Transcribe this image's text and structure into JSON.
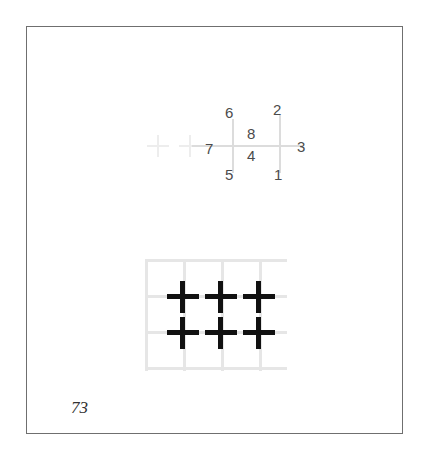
{
  "page": {
    "number": "73",
    "background_color": "#ffffff",
    "border_color": "#6f6f6f"
  },
  "top_diagram": {
    "name": "numbered-cross-reference-diagram",
    "grid_color": "#dcdcdc",
    "faint_cross_color": "#ededed",
    "label_color": "#4b4b4b",
    "faint_crosses": [
      {
        "id": "faint-cross-1",
        "x": 10,
        "y": 38
      },
      {
        "id": "faint-cross-2",
        "x": 42,
        "y": 38
      }
    ],
    "labels": [
      {
        "id": "label-6",
        "text": "6",
        "x": 88,
        "y": 8,
        "position": "top-left"
      },
      {
        "id": "label-2",
        "text": "2",
        "x": 136,
        "y": 5,
        "position": "top-right"
      },
      {
        "id": "label-8",
        "text": "8",
        "x": 110,
        "y": 29,
        "position": "center-upper"
      },
      {
        "id": "label-7",
        "text": "7",
        "x": 68,
        "y": 44,
        "position": "middle-left"
      },
      {
        "id": "label-3",
        "text": "3",
        "x": 160,
        "y": 42,
        "position": "middle-right"
      },
      {
        "id": "label-4",
        "text": "4",
        "x": 110,
        "y": 51,
        "position": "center-lower"
      },
      {
        "id": "label-5",
        "text": "5",
        "x": 88,
        "y": 70,
        "position": "bottom-left"
      },
      {
        "id": "label-1",
        "text": "1",
        "x": 137,
        "y": 70,
        "position": "bottom-right"
      }
    ]
  },
  "bottom_diagram": {
    "name": "cross-grid-diagram",
    "grid_color": "#e6e6e6",
    "cross_color": "#111111",
    "grid": {
      "vertical_line_x": [
        0,
        38,
        76,
        114
      ],
      "horizontal_line_y": [
        0,
        36,
        72,
        108
      ],
      "columns": 4,
      "rows": 4
    },
    "crosses": [
      {
        "id": "cross-r1c1",
        "row": 1,
        "col": 1,
        "x": 22,
        "y": 22
      },
      {
        "id": "cross-r1c2",
        "row": 1,
        "col": 2,
        "x": 60,
        "y": 22
      },
      {
        "id": "cross-r1c3",
        "row": 1,
        "col": 3,
        "x": 98,
        "y": 22
      },
      {
        "id": "cross-r2c1",
        "row": 2,
        "col": 1,
        "x": 22,
        "y": 58
      },
      {
        "id": "cross-r2c2",
        "row": 2,
        "col": 2,
        "x": 60,
        "y": 58
      },
      {
        "id": "cross-r2c3",
        "row": 2,
        "col": 3,
        "x": 98,
        "y": 58
      }
    ],
    "cross_count": 6
  }
}
